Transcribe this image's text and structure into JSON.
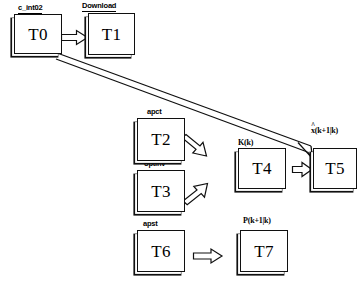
{
  "diagram": {
    "background_color": "#ffffff",
    "stroke_color": "#101010",
    "nodes": [
      {
        "id": "T0",
        "label": "T0",
        "caption": "c_int02",
        "caption_style": "underlined"
      },
      {
        "id": "T1",
        "label": "T1",
        "caption": "Download",
        "caption_style": "underlined"
      },
      {
        "id": "T2",
        "label": "T2",
        "caption": "apct",
        "caption_style": "plain"
      },
      {
        "id": "T3",
        "label": "T3",
        "caption": "optinv",
        "caption_style": "plain"
      },
      {
        "id": "T4",
        "label": "T4",
        "caption": "K(k)",
        "caption_style": "serif"
      },
      {
        "id": "T5",
        "label": "T5",
        "caption": "x(k+1|k)",
        "caption_style": "hat"
      },
      {
        "id": "T6",
        "label": "T6",
        "caption": "apst",
        "caption_style": "plain"
      },
      {
        "id": "T7",
        "label": "T7",
        "caption": "P(k+1|k)",
        "caption_style": "serif"
      }
    ],
    "edges": [
      {
        "id": "e0",
        "from": "T0",
        "to": "T1",
        "kind": "block-arrow",
        "direction": "right"
      },
      {
        "id": "e1",
        "from": "T0",
        "to": "T5",
        "kind": "long-open-arrow",
        "direction": "down-right"
      },
      {
        "id": "e2",
        "from": "T2",
        "to": "T4",
        "kind": "block-arrow",
        "direction": "down-right"
      },
      {
        "id": "e3",
        "from": "T3",
        "to": "T4",
        "kind": "block-arrow",
        "direction": "up-right"
      },
      {
        "id": "e4",
        "from": "T4",
        "to": "T5",
        "kind": "block-arrow",
        "direction": "right"
      },
      {
        "id": "e5",
        "from": "T6",
        "to": "T7",
        "kind": "block-arrow",
        "direction": "right"
      }
    ]
  }
}
